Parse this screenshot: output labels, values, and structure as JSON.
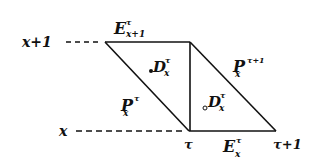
{
  "diagram": {
    "type": "lexis-diagram",
    "axis_labels": {
      "age_upper": "x+1",
      "age_lower": "x",
      "time_start": "τ",
      "time_end": "τ+1"
    },
    "regions": {
      "E_top": {
        "main": "E",
        "sup": "τ",
        "sub": "x+1"
      },
      "D_upper": {
        "main": "D",
        "sup": "τ",
        "sub": "x"
      },
      "P_left": {
        "main": "P",
        "sup": "τ",
        "sub": "x"
      },
      "P_right": {
        "main": "P",
        "sup": "τ+1",
        "sub": "x"
      },
      "D_lower": {
        "main": "D",
        "sup": "τ",
        "sub": "x"
      },
      "E_bottom": {
        "main": "E",
        "sup": "τ",
        "sub": "x"
      }
    },
    "colors": {
      "line": "#111111",
      "background": "#ffffff"
    }
  }
}
